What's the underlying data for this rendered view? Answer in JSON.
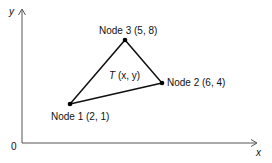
{
  "axes": {
    "y_label": "y",
    "x_label": "x",
    "origin_label": "0"
  },
  "nodes": [
    {
      "name": "Node 1",
      "coords": "(2, 1)",
      "label": "Node 1 (2, 1)"
    },
    {
      "name": "Node 2",
      "coords": "(6, 4)",
      "label": "Node 2 (6, 4)"
    },
    {
      "name": "Node 3",
      "coords": "(5, 8)",
      "label": "Node 3 (5, 8)"
    }
  ],
  "interior_point": {
    "symbol": "T",
    "args": " (x, y)"
  },
  "colors": {
    "axis": "#555555",
    "edge": "#111111",
    "node": "#000000"
  }
}
